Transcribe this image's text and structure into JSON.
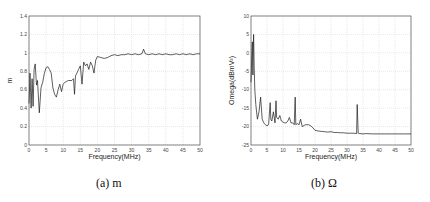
{
  "chart_data": [
    {
      "type": "line",
      "title": "",
      "xlabel": "Frequency(MHz)",
      "ylabel": "m",
      "xlim": [
        0,
        50
      ],
      "ylim": [
        0,
        1.4
      ],
      "xticks": [
        0,
        5,
        10,
        15,
        20,
        25,
        30,
        35,
        40,
        45,
        50
      ],
      "yticks": [
        0,
        0.2,
        0.4,
        0.6,
        0.8,
        1,
        1.2,
        1.4
      ],
      "ytick_labels": [
        "0",
        "0.2",
        "0.4",
        "0.6",
        "0.8",
        "1",
        "1.2",
        "1.4"
      ],
      "grid": true,
      "legend": null,
      "series": [
        {
          "name": "m",
          "x": [
            0,
            0.3,
            0.6,
            0.9,
            1.2,
            1.5,
            1.8,
            2.2,
            2.5,
            3,
            3.5,
            4,
            4.5,
            5,
            5.5,
            6,
            6.5,
            7,
            7.5,
            8,
            8.5,
            9,
            9.5,
            10,
            10.5,
            11,
            11.5,
            12,
            12.5,
            13,
            13.3,
            13.6,
            14,
            14.5,
            15,
            15.5,
            16,
            16.5,
            17,
            17.5,
            18,
            18.5,
            19,
            19.5,
            20,
            21,
            22,
            23,
            24,
            25,
            26,
            27,
            28,
            29,
            30,
            31,
            32,
            33,
            33.5,
            34,
            35,
            36,
            37,
            38,
            39,
            40,
            41,
            42,
            43,
            44,
            45,
            46,
            47,
            48,
            49,
            50
          ],
          "y": [
            0.45,
            0.78,
            0.4,
            0.72,
            0.42,
            0.82,
            0.88,
            0.65,
            0.7,
            0.35,
            0.62,
            0.68,
            0.78,
            0.84,
            0.85,
            0.82,
            0.78,
            0.62,
            0.55,
            0.52,
            0.6,
            0.66,
            0.58,
            0.66,
            0.68,
            0.69,
            0.7,
            0.7,
            0.7,
            0.72,
            0.55,
            0.75,
            0.78,
            0.82,
            0.86,
            0.66,
            0.9,
            0.86,
            0.88,
            0.82,
            0.9,
            0.86,
            0.78,
            0.92,
            0.96,
            0.95,
            0.94,
            0.95,
            0.97,
            0.98,
            0.97,
            0.98,
            0.98,
            0.99,
            0.98,
            0.99,
            0.98,
            0.99,
            1.04,
            0.99,
            0.98,
            0.99,
            0.98,
            0.99,
            0.98,
            0.99,
            0.98,
            0.98,
            0.99,
            0.98,
            0.99,
            0.98,
            0.99,
            0.98,
            0.99,
            0.99
          ]
        }
      ]
    },
    {
      "type": "line",
      "title": "",
      "xlabel": "Frequency(MHz)",
      "ylabel": "Omega(dBmV²)",
      "xlim": [
        0,
        50
      ],
      "ylim": [
        -25,
        10
      ],
      "xticks": [
        0,
        5,
        10,
        15,
        20,
        25,
        30,
        35,
        40,
        45,
        50
      ],
      "yticks": [
        -25,
        -20,
        -15,
        -10,
        -5,
        0,
        5,
        10
      ],
      "ytick_labels": [
        "-25",
        "-20",
        "-15",
        "-10",
        "-5",
        "0",
        "5",
        "10"
      ],
      "grid": true,
      "legend": null,
      "series": [
        {
          "name": "Omega",
          "x": [
            0,
            0.2,
            0.4,
            0.6,
            0.8,
            1.0,
            1.2,
            1.5,
            2,
            2.5,
            3,
            3.5,
            4,
            4.5,
            5,
            5.5,
            6,
            6.2,
            6.5,
            7,
            7.5,
            7.8,
            8,
            8.5,
            9,
            9.5,
            10,
            10.5,
            11,
            11.5,
            12,
            12.5,
            13,
            13.5,
            13.8,
            14,
            14.5,
            15,
            15.5,
            16,
            17,
            18,
            19,
            20,
            21,
            22,
            23,
            24,
            25,
            26,
            27,
            28,
            29,
            30,
            31,
            32,
            33,
            33.2,
            33.5,
            34,
            35,
            36,
            38,
            40,
            42,
            44,
            46,
            48,
            50
          ],
          "y": [
            -8,
            -2,
            3,
            -6,
            5,
            -4,
            -10,
            -14,
            -18,
            -16,
            -12,
            -18,
            -19,
            -19.5,
            -19.8,
            -19.5,
            -13.5,
            -18,
            -18.5,
            -16,
            -19,
            -13,
            -17.5,
            -18,
            -17,
            -18.5,
            -18.8,
            -19,
            -19,
            -18.5,
            -17.5,
            -19,
            -19,
            -19.5,
            -12,
            -19.5,
            -19.2,
            -19.5,
            -18,
            -20,
            -19.5,
            -19.5,
            -20,
            -21,
            -21.2,
            -21.3,
            -21.4,
            -21.5,
            -21.4,
            -21.6,
            -21.6,
            -21.7,
            -21.7,
            -21.8,
            -21.8,
            -21.8,
            -21.9,
            -14,
            -21.8,
            -21.9,
            -22,
            -21.9,
            -22,
            -22,
            -22,
            -22,
            -22,
            -22,
            -22
          ]
        }
      ]
    }
  ],
  "captions": {
    "a": "(a) m",
    "b": "(b)  Ω"
  }
}
